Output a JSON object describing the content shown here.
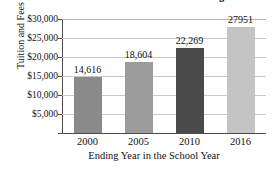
{
  "chart_data": {
    "type": "bar",
    "title": "Tuition and Fees at Four-Year U.S. Colleges",
    "xlabel": "Ending Year in the School Year",
    "ylabel": "Tuition and Fees",
    "categories": [
      "2000",
      "2005",
      "2010",
      "2016"
    ],
    "values": [
      14616,
      18604,
      22269,
      27951
    ],
    "value_labels": [
      "14,616",
      "18,604",
      "22,269",
      "27951"
    ],
    "ylim": [
      0,
      30000
    ],
    "ytick_values": [
      5000,
      10000,
      15000,
      20000,
      25000,
      30000
    ],
    "ytick_labels": [
      "$5,000",
      "$10,000",
      "$15,000",
      "$20,000",
      "$25,000",
      "$30,000"
    ],
    "grid": true,
    "legend": false,
    "bar_colors": [
      "#8a8a8a",
      "#9b9b9b",
      "#4a4a4a",
      "#c4c4c4"
    ],
    "axis_color": "#4a4a4a",
    "grid_color": "#c9c9c9",
    "background": "#ffffff"
  }
}
